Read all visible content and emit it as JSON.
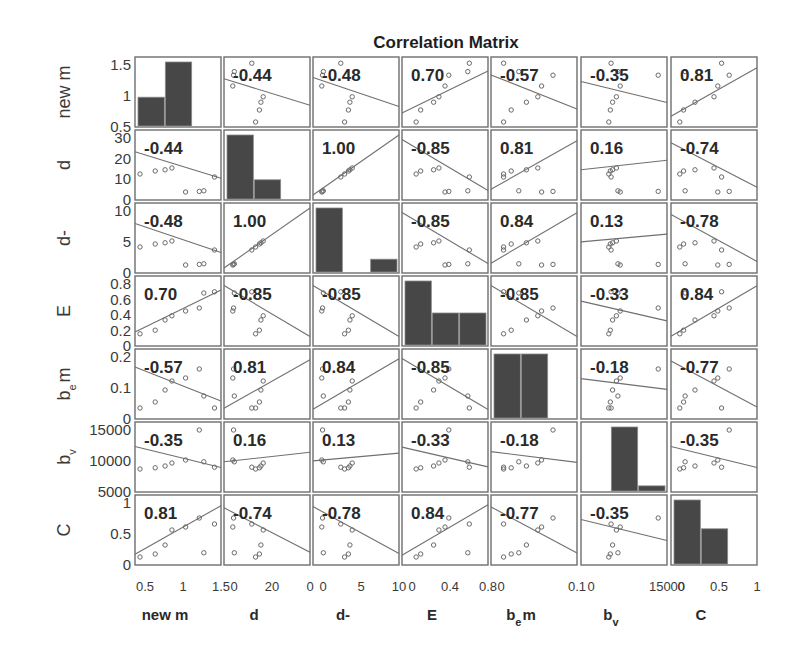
{
  "chart_data": {
    "type": "scatter-matrix",
    "title": "Correlation Matrix",
    "variables": [
      {
        "name": "new m",
        "base": "new m",
        "sub": "",
        "suffix": "",
        "yticks": [
          "1.5",
          "1",
          "0.5"
        ],
        "xticks": [
          "0.5",
          "1",
          "1.5"
        ]
      },
      {
        "name": "d",
        "base": "d",
        "sub": "",
        "suffix": "",
        "yticks": [
          "30",
          "20",
          "10",
          "0"
        ],
        "xticks": [
          "0",
          "20",
          "0"
        ]
      },
      {
        "name": "d-",
        "base": "d-",
        "sub": "",
        "suffix": "",
        "yticks": [
          "10",
          "5",
          "0"
        ],
        "xticks": [
          "0",
          "5",
          "10"
        ]
      },
      {
        "name": "E",
        "base": "E",
        "sub": "",
        "suffix": "",
        "yticks": [
          "0.8",
          "0.6",
          "0.4",
          "0.2",
          "0"
        ],
        "xticks": [
          "0",
          "0.4",
          "0.8"
        ]
      },
      {
        "name": "b_e m",
        "base": "b",
        "sub": "e",
        "suffix": "m",
        "yticks": [
          "0.2",
          "0.1",
          "0"
        ],
        "xticks": [
          "0",
          "0.1"
        ]
      },
      {
        "name": "b_v",
        "base": "b",
        "sub": "v",
        "suffix": "",
        "yticks": [
          "15000",
          "10000",
          "5000"
        ],
        "xticks": [
          "0",
          "15000"
        ]
      },
      {
        "name": "C",
        "base": "C",
        "sub": "",
        "suffix": "",
        "yticks": [
          "1",
          "0.5",
          "0"
        ],
        "xticks": [
          "0",
          "0.5",
          "1"
        ]
      }
    ],
    "correlations": [
      [
        null,
        -0.44,
        -0.48,
        0.7,
        -0.57,
        -0.35,
        0.81
      ],
      [
        -0.44,
        null,
        1.0,
        -0.85,
        0.81,
        0.16,
        -0.74
      ],
      [
        -0.48,
        1.0,
        null,
        -0.85,
        0.84,
        0.13,
        -0.78
      ],
      [
        0.7,
        -0.85,
        -0.85,
        null,
        -0.85,
        -0.33,
        0.84
      ],
      [
        -0.57,
        0.81,
        0.84,
        -0.85,
        null,
        -0.18,
        -0.77
      ],
      [
        -0.35,
        0.16,
        0.13,
        -0.33,
        -0.18,
        null,
        -0.35
      ],
      [
        0.81,
        -0.74,
        -0.78,
        0.84,
        -0.77,
        -0.35,
        null
      ]
    ],
    "correlation_labels": [
      [
        "",
        "-0.44",
        "-0.48",
        "0.70",
        "-0.57",
        "-0.35",
        "0.81"
      ],
      [
        "-0.44",
        "",
        "1.00",
        "-0.85",
        "0.81",
        "0.16",
        "-0.74"
      ],
      [
        "-0.48",
        "1.00",
        "",
        "-0.85",
        "0.84",
        "0.13",
        "-0.78"
      ],
      [
        "0.70",
        "-0.85",
        "-0.85",
        "",
        "-0.85",
        "-0.33",
        "0.84"
      ],
      [
        "-0.57",
        "0.81",
        "0.84",
        "-0.85",
        "",
        "-0.18",
        "-0.77"
      ],
      [
        "-0.35",
        "0.16",
        "0.13",
        "-0.33",
        "-0.18",
        "",
        "-0.35"
      ],
      [
        "0.81",
        "-0.74",
        "-0.78",
        "0.84",
        "-0.77",
        "-0.35",
        ""
      ]
    ],
    "histograms": [
      [
        0.45,
        1.0,
        0
      ],
      [
        1.0,
        0.3
      ],
      [
        1.0,
        0,
        0.2
      ],
      [
        1.0,
        0.5,
        0.5
      ],
      [
        1.0,
        1.0,
        0
      ],
      [
        0,
        1.0,
        0.08
      ],
      [
        1.0,
        0.55
      ]
    ],
    "normalized_values": [
      [
        0.0,
        0.2,
        0.33,
        0.42,
        0.6,
        0.78,
        0.84,
        0.98
      ],
      [
        0.35,
        0.4,
        0.42,
        0.45,
        0.05,
        0.06,
        0.07,
        0.3
      ],
      [
        0.35,
        0.4,
        0.42,
        0.45,
        0.05,
        0.06,
        0.07,
        0.3
      ],
      [
        0.12,
        0.18,
        0.35,
        0.42,
        0.5,
        0.55,
        0.8,
        0.82
      ],
      [
        0.1,
        0.2,
        0.4,
        0.55,
        0.6,
        0.75,
        0.3,
        0.1
      ],
      [
        0.3,
        0.32,
        0.35,
        0.4,
        0.45,
        0.95,
        0.42,
        0.33
      ],
      [
        0.05,
        0.1,
        0.25,
        0.5,
        0.55,
        0.7,
        0.12,
        0.6
      ]
    ],
    "grid": false,
    "legend": "none"
  }
}
